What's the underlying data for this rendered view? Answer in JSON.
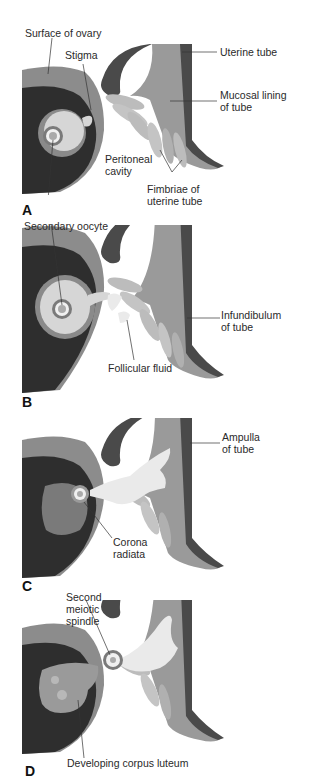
{
  "figure": {
    "panels": [
      {
        "letter": "A",
        "labels": {
          "surface_of_ovary": "Surface of ovary",
          "stigma": "Stigma",
          "uterine_tube": "Uterine tube",
          "mucosal_lining": "Mucosal lining\nof tube",
          "peritoneal_cavity": "Peritoneal\ncavity",
          "fimbriae": "Fimbriae of\nuterine tube"
        }
      },
      {
        "letter": "B",
        "labels": {
          "secondary_oocyte": "Secondary oocyte",
          "infundibulum": "Infundibulum\nof tube",
          "follicular_fluid": "Follicular fluid"
        }
      },
      {
        "letter": "C",
        "labels": {
          "ampulla": "Ampulla\nof tube",
          "corona_radiata": "Corona\nradiata"
        }
      },
      {
        "letter": "D",
        "labels": {
          "second_meiotic_spindle": "Second\nmeiotic\nspindle",
          "developing_corpus_luteum": "Developing corpus luteum"
        }
      }
    ],
    "colors": {
      "ovary_surface": "#8c8c8c",
      "ovary_dark": "#2e2e2e",
      "follicle_ring": "#8a8a8a",
      "follicle_fluid": "#d6d6d6",
      "tube_outer": "#4a4a4a",
      "tube_mid": "#9a9a9a",
      "tube_light": "#c4c4c4",
      "fimbria_light": "#e6e6e6"
    }
  }
}
